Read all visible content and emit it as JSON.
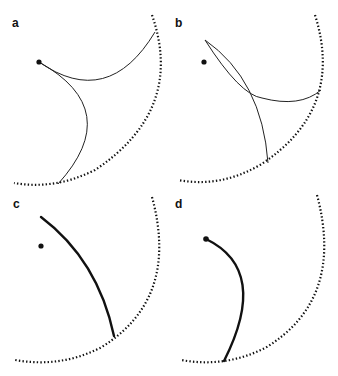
{
  "figure": {
    "panels": [
      {
        "label": "a",
        "description": "Point source with two thin curves reaching the dotted boundary arc"
      },
      {
        "label": "b",
        "description": "Point with two thin intersecting curves reaching the dotted boundary arc"
      },
      {
        "label": "c",
        "description": "Point beside a single thick curve ending on the dotted boundary arc"
      },
      {
        "label": "d",
        "description": "Single thick curve starting at the point and ending on the dotted boundary arc"
      }
    ],
    "colors": {
      "stroke": "#111111",
      "background": "#ffffff"
    }
  }
}
